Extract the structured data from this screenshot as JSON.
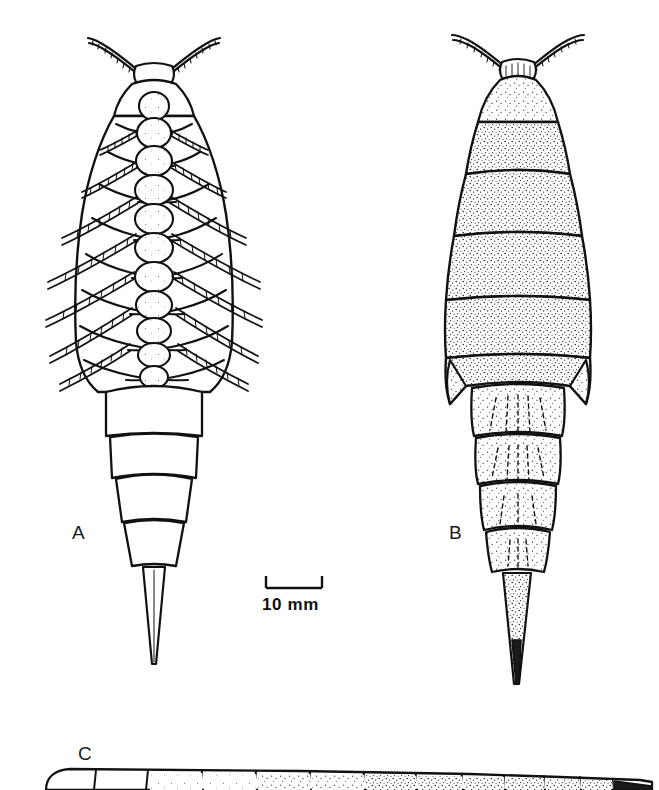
{
  "figure": {
    "background_color": "#ffffff",
    "ink_color": "#111111",
    "panels": [
      {
        "id": "A",
        "label": "A",
        "view": "ventral",
        "rendering": "outline-with-light-stipple",
        "midline_nodule_count": 11,
        "leg_pair_count": 8,
        "antenna_count": 2,
        "pleon_segment_count": 4,
        "has_telson_spine": true
      },
      {
        "id": "B",
        "label": "B",
        "view": "dorsal",
        "rendering": "dense-stipple-shading",
        "tergite_count": 6,
        "pleon_segment_count": 4,
        "antenna_count": 2,
        "has_telson_spine": true
      },
      {
        "id": "C",
        "label": "C",
        "view": "lateral",
        "rendering": "outline-with-stipple",
        "segment_count": 12,
        "cropped_at_bottom": true
      }
    ]
  },
  "scale_bar": {
    "label": "10 mm",
    "value": 10,
    "unit": "mm",
    "bracket_style": "u-bracket-downward-ticks",
    "bar_length_px": 56
  }
}
